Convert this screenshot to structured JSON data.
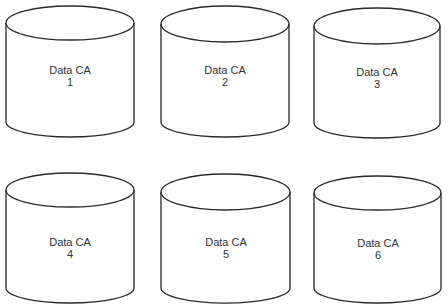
{
  "diagram": {
    "type": "database-cylinders",
    "stroke_color": "#2a2a2a",
    "text_color": "#333333",
    "cylinders": [
      {
        "name": "Data CA",
        "number": "1"
      },
      {
        "name": "Data CA",
        "number": "2"
      },
      {
        "name": "Data CA",
        "number": "3"
      },
      {
        "name": "Data CA",
        "number": "4"
      },
      {
        "name": "Data CA",
        "number": "5"
      },
      {
        "name": "Data CA",
        "number": "6"
      }
    ]
  }
}
